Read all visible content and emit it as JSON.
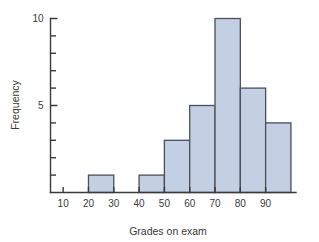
{
  "chart_data": {
    "type": "bar",
    "title": "",
    "subtitle": "",
    "xlabel": "Grades on exam",
    "ylabel": "Frequency",
    "bin_width": 10,
    "bin_starts": [
      20,
      30,
      40,
      50,
      60,
      70,
      80,
      90
    ],
    "categories": [
      "20-30",
      "30-40",
      "40-50",
      "50-60",
      "60-70",
      "70-80",
      "80-90",
      "90-100"
    ],
    "values": [
      1,
      0,
      1,
      3,
      5,
      10,
      6,
      4
    ],
    "x_tick_labels": [
      "10",
      "20",
      "30",
      "40",
      "50",
      "60",
      "70",
      "80",
      "90"
    ],
    "x_tick_values": [
      10,
      20,
      30,
      40,
      50,
      60,
      70,
      80,
      90
    ],
    "y_tick_labels": [
      "5",
      "10"
    ],
    "y_tick_values": [
      5,
      10
    ],
    "y_minor_ticks": [
      1,
      2,
      3,
      4,
      6,
      7,
      8,
      9
    ],
    "xlim": [
      5,
      102
    ],
    "ylim": [
      0,
      10
    ],
    "grid": false,
    "legend": false,
    "legend_position": "none",
    "bar_fill": "#c3cfe2",
    "bar_edge": "#4a4f5c",
    "axis_color": "#3a3a3a",
    "text_color": "#3a3a3a"
  }
}
